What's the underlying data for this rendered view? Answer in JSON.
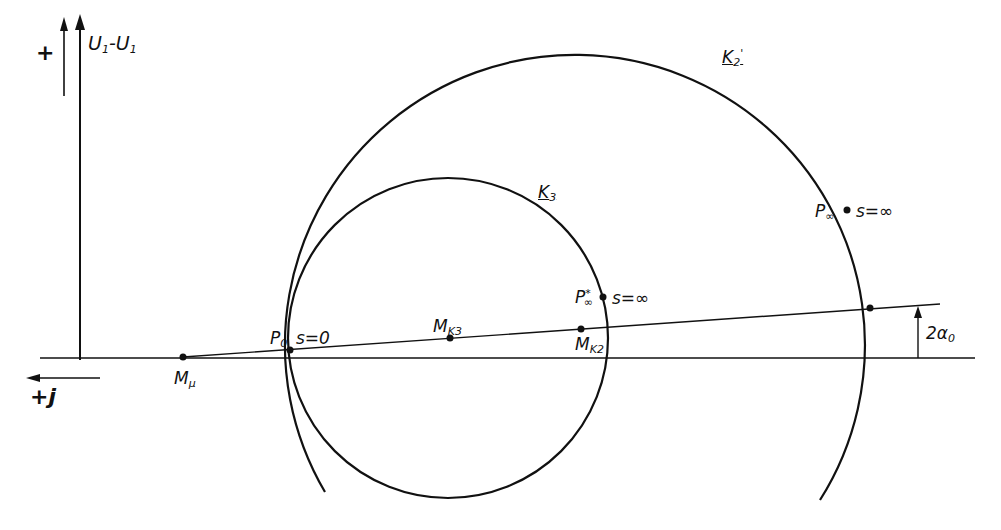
{
  "diagram": {
    "type": "circle-diagram (current locus) of induction machine",
    "axes": {
      "vertical_label": "U1-U1",
      "vertical_sign": "+",
      "horizontal_label": "+j"
    },
    "circles": [
      {
        "name": "K3",
        "label": "K3",
        "center_label": "MK3"
      },
      {
        "name": "K2",
        "label": "K2'",
        "center_label": "MK2"
      }
    ],
    "points": {
      "Mu": "Mμ",
      "P0": "P0",
      "P0_slip": "s=0",
      "Pinf_star": "P∞*",
      "Pinf_star_slip": "s=∞",
      "Pinf": "P∞",
      "Pinf_slip": "s=∞"
    },
    "angle_label": "2α0"
  },
  "labels": {
    "plus": "+",
    "u_main": "U",
    "u_sub1": "1",
    "dash": "-",
    "u_sub2": "1",
    "plus_j": "+j",
    "mu_M": "M",
    "mu_sub": "μ",
    "p0_P": "P",
    "p0_sub": "0",
    "s0": "s=0",
    "mk3_M": "M",
    "mk3_sub": "K3",
    "mk2_M": "M",
    "mk2_sub": "K2",
    "pinfstar_P": "P",
    "pinfstar_sup": "*",
    "pinfstar_sub": "∞",
    "sinf1": "s=∞",
    "pinf_P": "P",
    "pinf_sub": "∞",
    "sinf2": "s=∞",
    "k3_K": "K",
    "k3_sub": "3",
    "k2_K": "K",
    "k2_sub": "2",
    "k2_prime": "'",
    "alpha_main": "2α",
    "alpha_sub": "0"
  }
}
